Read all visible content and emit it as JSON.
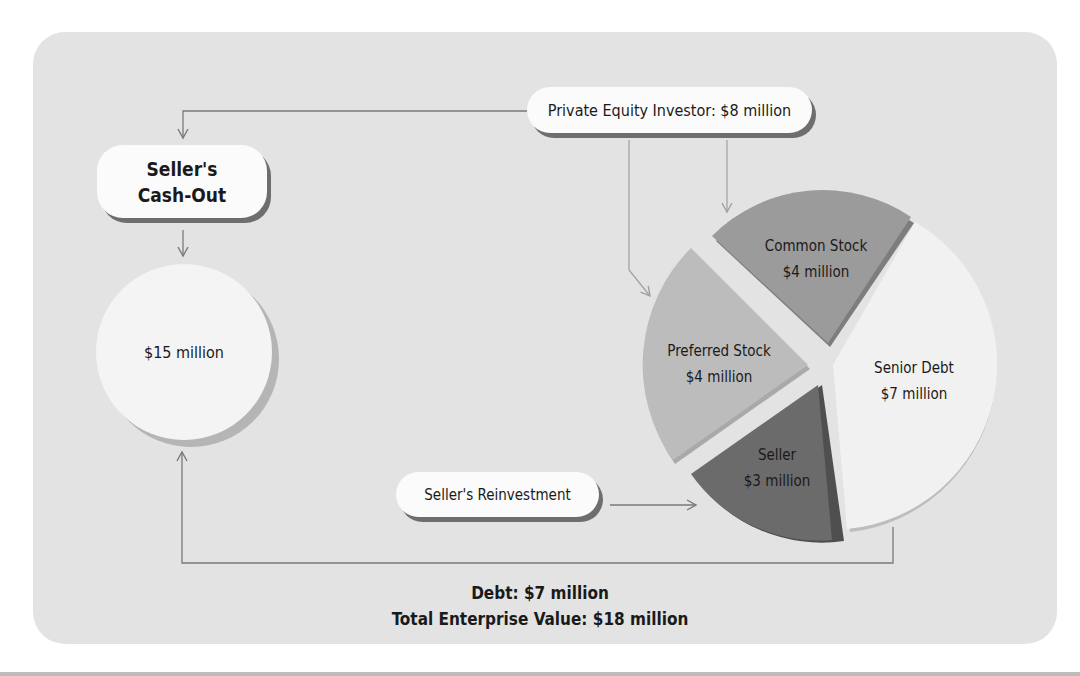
{
  "diagram": {
    "nodes": {
      "private_equity": "Private Equity Investor: $8 million",
      "cash_out_line1": "Seller's",
      "cash_out_line2": "Cash-Out",
      "cash_out_amount": "$15 million",
      "reinvestment": "Seller's Reinvestment"
    },
    "pie": [
      {
        "name": "Common Stock",
        "value": "$4 million",
        "amount": 4,
        "color": "#9b9b9b"
      },
      {
        "name": "Senior Debt",
        "value": "$7 million",
        "amount": 7,
        "color": "#f1f1f1"
      },
      {
        "name": "Seller",
        "value": "$3 million",
        "amount": 3,
        "color": "#6b6b6b"
      },
      {
        "name": "Preferred Stock",
        "value": "$4 million",
        "amount": 4,
        "color": "#bcbcbc"
      }
    ],
    "summary": {
      "debt": "Debt: $7 million",
      "total": "Total Enterprise Value: $18 million"
    },
    "colors": {
      "panel": "#e3e3e3",
      "connector": "#7a7a7a",
      "text": "#1a1a1a"
    }
  }
}
